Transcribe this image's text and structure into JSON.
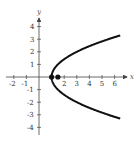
{
  "chart_data": {
    "type": "line",
    "title": "",
    "xlabel": "x",
    "ylabel": "y",
    "xlim": [
      -2.5,
      6.8
    ],
    "ylim": [
      -4.5,
      4.8
    ],
    "grid": false,
    "x_ticks": [
      "-2",
      "-1",
      "2",
      "3",
      "4",
      "5",
      "6"
    ],
    "y_ticks": [
      "4",
      "3",
      "2",
      "1",
      "-1",
      "-2",
      "-3",
      "-4"
    ],
    "series": [
      {
        "name": "parabola x = y^2/2 + 1",
        "description": "Rightward-opening parabola with vertex at (1, 0)",
        "points": [
          [
            6.4,
            3.3
          ],
          [
            5.5,
            3.0
          ],
          [
            3,
            2
          ],
          [
            1.5,
            1
          ],
          [
            1,
            0
          ],
          [
            1.5,
            -1
          ],
          [
            3,
            -2
          ],
          [
            5.5,
            -3
          ],
          [
            6.4,
            -3.3
          ]
        ]
      }
    ],
    "marked_points": [
      {
        "label": "vertex",
        "x": 1,
        "y": 0
      },
      {
        "label": "focus",
        "x": 1.5,
        "y": 0
      }
    ],
    "colors": {
      "curve": "#111111",
      "axis": "#444444"
    }
  }
}
